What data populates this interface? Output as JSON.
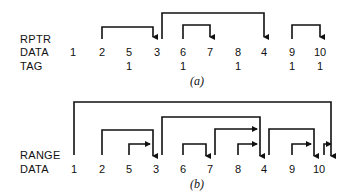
{
  "part_a": {
    "caption": "(a)",
    "labels": {
      "rptr": "RPTR",
      "data": "DATA",
      "tag": "TAG"
    },
    "data": [
      "1",
      "2",
      "5",
      "3",
      "6",
      "7",
      "8",
      "4",
      "9",
      "10"
    ],
    "tags": [
      "",
      "",
      "1",
      "",
      "1",
      "",
      "1",
      "",
      "1",
      "1"
    ],
    "pointers": [
      {
        "from": "2",
        "to": "3"
      },
      {
        "from": "3",
        "to": "4"
      },
      {
        "from": "6",
        "to": "7"
      },
      {
        "from": "9",
        "to": "10"
      }
    ]
  },
  "part_b": {
    "caption": "(b)",
    "labels": {
      "range": "RANGE",
      "data": "DATA"
    },
    "data": [
      "1",
      "2",
      "5",
      "3",
      "6",
      "7",
      "8",
      "4",
      "9",
      "10"
    ],
    "ranges": [
      {
        "from": "1",
        "to": "10"
      },
      {
        "from": "3",
        "to": "4"
      },
      {
        "from": "2",
        "to": "3"
      },
      {
        "from": "5",
        "to": "3"
      },
      {
        "from": "6",
        "to": "7"
      },
      {
        "from": "7",
        "to": "4"
      },
      {
        "from": "8",
        "to": "4"
      },
      {
        "from": "4",
        "to": "10"
      },
      {
        "from": "9",
        "to": "10"
      },
      {
        "from": "10",
        "to": "10"
      }
    ]
  }
}
